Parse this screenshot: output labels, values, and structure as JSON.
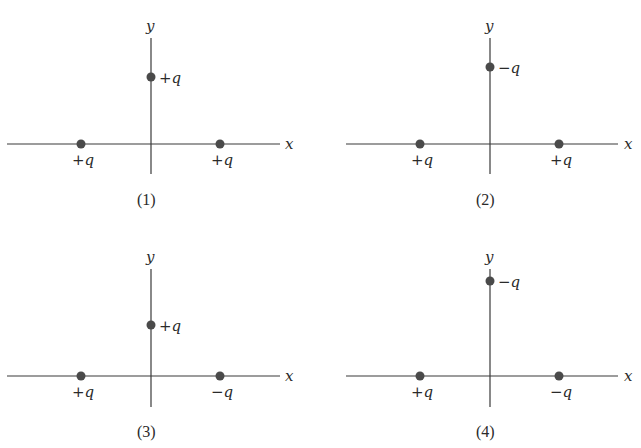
{
  "figure": {
    "panels": [
      {
        "caption": "(1)",
        "x_axis_label": "x",
        "y_axis_label": "y",
        "charges": {
          "top": "+q",
          "left": "+q",
          "right": "+q"
        }
      },
      {
        "caption": "(2)",
        "x_axis_label": "x",
        "y_axis_label": "y",
        "charges": {
          "top": "−q",
          "left": "+q",
          "right": "+q"
        }
      },
      {
        "caption": "(3)",
        "x_axis_label": "x",
        "y_axis_label": "y",
        "charges": {
          "top": "+q",
          "left": "+q",
          "right": "−q"
        }
      },
      {
        "caption": "(4)",
        "x_axis_label": "x",
        "y_axis_label": "y",
        "charges": {
          "top": "−q",
          "left": "+q",
          "right": "−q"
        }
      }
    ],
    "colors": {
      "axis": "#3a3a3a",
      "charge_dot": "#4a4a4a",
      "text": "#2a2a2a"
    }
  }
}
